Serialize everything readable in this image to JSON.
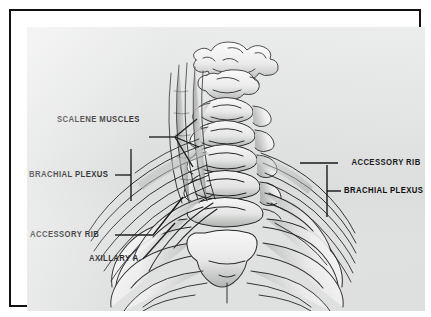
{
  "figure": {
    "kind": "anatomical-line-drawing",
    "view": "anterior",
    "plate_color": "#e3e5e4",
    "ink_color": "#1a1a1d",
    "frame_color": "#111114",
    "mat_color": "#ffffff"
  },
  "labels": [
    {
      "id": "scalene-muscles",
      "text": "SCALENE MUSCLES",
      "side": "left"
    },
    {
      "id": "accessory-rib-right",
      "text": "ACCESSORY RIB",
      "side": "right"
    },
    {
      "id": "brachial-plexus-left",
      "text": "BRACHIAL PLEXUS",
      "side": "left"
    },
    {
      "id": "brachial-plexus-right",
      "text": "BRACHIAL PLEXUS",
      "side": "right"
    },
    {
      "id": "accessory-rib-left",
      "text": "ACCESSORY RIB",
      "side": "left"
    },
    {
      "id": "axillary-artery",
      "text": "AXILLARY A.",
      "side": "left"
    }
  ]
}
